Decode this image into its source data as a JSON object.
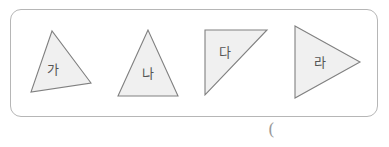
{
  "page": {
    "background_color": "#ffffff",
    "width": 389,
    "height": 147
  },
  "figure_box": {
    "border_color": "#b6b6b6",
    "fill_color": "#ffffff",
    "corner_radius": 11
  },
  "shapes": {
    "fill_color": "#f0f0f0",
    "stroke_color": "#808080",
    "items": [
      {
        "label": "가",
        "kind": "scalene-triangle",
        "points": "52,31 31,92 91,83"
      },
      {
        "label": "나",
        "kind": "isosceles-triangle",
        "points": "148,30 118,96 178,96"
      },
      {
        "label": "다",
        "kind": "right-triangle",
        "points": "205,30 267,30 205,95"
      },
      {
        "label": "라",
        "kind": "right-pointing-triangle",
        "points": "295,26 360,62 295,98"
      }
    ]
  },
  "annotations": {
    "parenthesis": "("
  }
}
